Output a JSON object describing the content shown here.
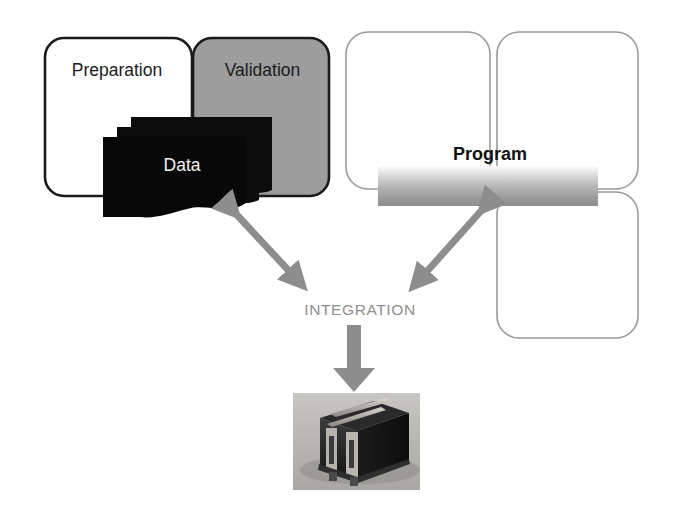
{
  "diagram": {
    "title_text_nodes": {
      "preparation": "Preparation",
      "validation": "Validation",
      "data": "Data",
      "program": "Program",
      "integration": "INTEGRATION"
    },
    "left_group": {
      "boxes": [
        {
          "name": "preparation",
          "label": "Preparation",
          "fill": "#ffffff",
          "stroke": "#1a1a1a"
        },
        {
          "name": "validation",
          "label": "Validation",
          "fill": "#9d9d9d",
          "stroke": "#1a1a1a"
        }
      ],
      "stack": {
        "label": "Data",
        "fill": "#080808",
        "sheet_count": 3,
        "text_color": "#f2f2f2"
      }
    },
    "right_group": {
      "boxes": [
        {
          "name": "top-left-panel",
          "fill": "#ffffff",
          "stroke": "#9a9a9a"
        },
        {
          "name": "top-right-panel",
          "fill": "#ffffff",
          "stroke": "#9a9a9a"
        },
        {
          "name": "bottom-right-panel",
          "fill": "#ffffff",
          "stroke": "#9a9a9a"
        }
      ],
      "bar": {
        "label": "Program",
        "gradient_from": "#f4f4f4",
        "gradient_to": "#909090"
      }
    },
    "connectors": {
      "integration_label": "INTEGRATION",
      "arrow_color": "#8d8d8d",
      "arrows": [
        {
          "name": "data-to-integration",
          "type": "double-headed",
          "direction": "diagonal-down-right"
        },
        {
          "name": "program-to-integration",
          "type": "double-headed",
          "direction": "diagonal-down-left"
        },
        {
          "name": "integration-to-hardware",
          "type": "single-headed",
          "direction": "down"
        }
      ]
    },
    "hardware": {
      "name": "server-photo",
      "caption": "",
      "background": "#b6b4b0"
    },
    "colors": {
      "black": "#080808",
      "dark_outline": "#1a1a1a",
      "gray_fill": "#9d9d9d",
      "light_outline": "#9a9a9a",
      "arrow_gray": "#8d8d8d",
      "label_gray": "#8f8f8f",
      "page_background": "#ffffff"
    }
  }
}
